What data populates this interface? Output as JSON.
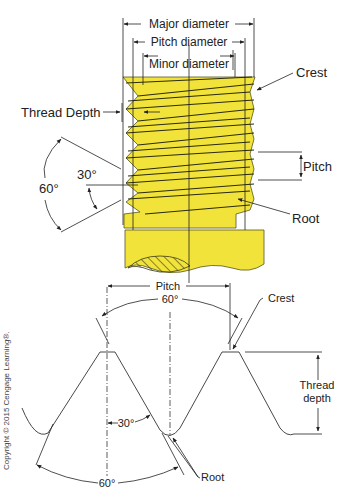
{
  "diagram": {
    "colors": {
      "bolt_fill": "#f2e33a",
      "bolt_stroke": "#3a3a1a",
      "line": "#222222"
    },
    "top_view": {
      "labels": {
        "major_diameter": "Major diameter",
        "pitch_diameter": "Pitch diameter",
        "minor_diameter": "Minor diameter",
        "crest": "Crest",
        "thread_depth": "Thread Depth",
        "pitch": "Pitch",
        "root": "Root",
        "angle_60": "60°",
        "angle_30": "30°"
      }
    },
    "profile_view": {
      "labels": {
        "pitch": "Pitch",
        "angle_60_top": "60°",
        "crest": "Crest",
        "thread_depth_line1": "Thread",
        "thread_depth_line2": "depth",
        "angle_30": "30°",
        "angle_60_bottom": "60°",
        "root": "Root"
      }
    },
    "copyright": "Copyright © 2015 Cengage Learning®."
  }
}
